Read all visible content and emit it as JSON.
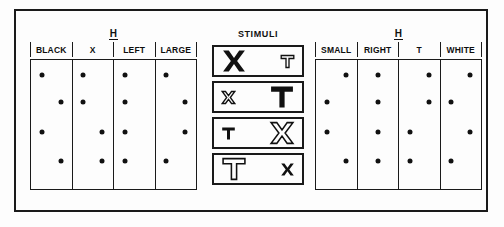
{
  "figure": {
    "left_panel": {
      "title": "H",
      "columns": [
        {
          "label": "BLACK",
          "dots": [
            {
              "row": 1,
              "side": "left"
            },
            {
              "row": 2,
              "side": "right"
            },
            {
              "row": 3,
              "side": "left"
            },
            {
              "row": 4,
              "side": "right"
            }
          ]
        },
        {
          "label": "X",
          "dots": [
            {
              "row": 1,
              "side": "left"
            },
            {
              "row": 2,
              "side": "left"
            },
            {
              "row": 3,
              "side": "right"
            },
            {
              "row": 4,
              "side": "right"
            }
          ]
        },
        {
          "label": "LEFT",
          "dots": [
            {
              "row": 1,
              "side": "left"
            },
            {
              "row": 2,
              "side": "left"
            },
            {
              "row": 3,
              "side": "left"
            },
            {
              "row": 4,
              "side": "left"
            }
          ]
        },
        {
          "label": "LARGE",
          "dots": [
            {
              "row": 1,
              "side": "left"
            },
            {
              "row": 2,
              "side": "right"
            },
            {
              "row": 3,
              "side": "right"
            },
            {
              "row": 4,
              "side": "left"
            }
          ]
        }
      ]
    },
    "right_panel": {
      "title": "H",
      "columns": [
        {
          "label": "SMALL",
          "dots": [
            {
              "row": 1,
              "side": "right"
            },
            {
              "row": 2,
              "side": "left"
            },
            {
              "row": 3,
              "side": "left"
            },
            {
              "row": 4,
              "side": "right"
            }
          ]
        },
        {
          "label": "RIGHT",
          "dots": [
            {
              "row": 1,
              "side": "mid"
            },
            {
              "row": 2,
              "side": "mid"
            },
            {
              "row": 3,
              "side": "mid"
            },
            {
              "row": 4,
              "side": "mid"
            }
          ]
        },
        {
          "label": "T",
          "dots": [
            {
              "row": 1,
              "side": "right"
            },
            {
              "row": 2,
              "side": "right"
            },
            {
              "row": 3,
              "side": "left"
            },
            {
              "row": 4,
              "side": "left"
            }
          ]
        },
        {
          "label": "WHITE",
          "dots": [
            {
              "row": 1,
              "side": "right"
            },
            {
              "row": 2,
              "side": "left"
            },
            {
              "row": 3,
              "side": "right"
            },
            {
              "row": 4,
              "side": "left"
            }
          ]
        }
      ]
    },
    "stimuli": {
      "title": "STIMULI",
      "items": [
        {
          "index": 1,
          "left": {
            "letter": "X",
            "size": "large",
            "fill": "solid"
          },
          "right": {
            "letter": "T",
            "size": "small",
            "fill": "outline"
          }
        },
        {
          "index": 2,
          "left": {
            "letter": "X",
            "size": "small",
            "fill": "outline"
          },
          "right": {
            "letter": "T",
            "size": "large",
            "fill": "solid"
          }
        },
        {
          "index": 3,
          "left": {
            "letter": "T",
            "size": "small",
            "fill": "solid"
          },
          "right": {
            "letter": "X",
            "size": "large",
            "fill": "outline"
          }
        },
        {
          "index": 4,
          "left": {
            "letter": "T",
            "size": "large",
            "fill": "outline"
          },
          "right": {
            "letter": "X",
            "size": "small",
            "fill": "solid"
          }
        }
      ]
    },
    "colors": {
      "ink": "#111111",
      "frame": "#1a1a1a",
      "paper": "#fdfdfd"
    }
  }
}
